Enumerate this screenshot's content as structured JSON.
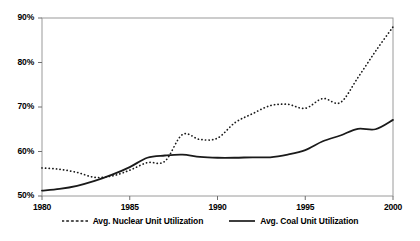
{
  "chart_data": {
    "type": "line",
    "title": "",
    "xlabel": "",
    "ylabel": "",
    "xlim": [
      1980,
      2000
    ],
    "ylim": [
      0.5,
      0.9
    ],
    "grid": false,
    "legend_position": "bottom",
    "x_ticks": [
      "1980",
      "1985",
      "1990",
      "1995",
      "2000"
    ],
    "x_tick_values": [
      1980,
      1985,
      1990,
      1995,
      2000
    ],
    "y_ticks": [
      "50%",
      "60%",
      "70%",
      "80%",
      "90%"
    ],
    "y_tick_values": [
      50,
      60,
      70,
      80,
      90
    ],
    "x": [
      1980,
      1981,
      1982,
      1983,
      1984,
      1985,
      1986,
      1987,
      1988,
      1989,
      1990,
      1991,
      1992,
      1993,
      1994,
      1995,
      1996,
      1997,
      1998,
      1999,
      2000
    ],
    "series": [
      {
        "name": "Avg. Nuclear Unit Utilization",
        "style": "dotted",
        "color": "#1a1a1a",
        "values": [
          56.3,
          56.0,
          55.3,
          54.2,
          54.5,
          55.8,
          57.5,
          57.8,
          63.8,
          62.7,
          63.0,
          66.5,
          68.5,
          70.3,
          70.6,
          69.7,
          71.9,
          71.0,
          76.6,
          82.5,
          88.0
        ]
      },
      {
        "name": "Avg. Coal Unit Utilization",
        "style": "solid",
        "color": "#1a1a1a",
        "values": [
          51.2,
          51.6,
          52.3,
          53.4,
          54.8,
          56.5,
          58.6,
          59.1,
          59.3,
          58.8,
          58.6,
          58.6,
          58.7,
          58.7,
          59.3,
          60.3,
          62.3,
          63.6,
          65.1,
          65.0,
          67.1
        ]
      }
    ]
  },
  "legend": {
    "items": [
      {
        "label": "Avg. Nuclear Unit Utilization",
        "style": "dotted"
      },
      {
        "label": "Avg. Coal Unit Utilization",
        "style": "solid"
      }
    ]
  }
}
